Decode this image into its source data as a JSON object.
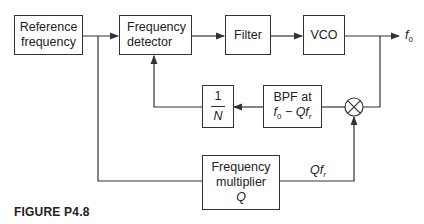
{
  "diagram": {
    "figure_caption": "FIGURE P4.8",
    "blocks": {
      "reference": {
        "line1": "Reference",
        "line2": "frequency"
      },
      "detector": {
        "line1": "Frequency",
        "line2": "detector"
      },
      "filter": {
        "label": "Filter"
      },
      "vco": {
        "label": "VCO"
      },
      "divider": {
        "numerator": "1",
        "denominator": "N"
      },
      "bpf": {
        "line1": "BPF at",
        "line2_f": "f",
        "line2_sub": "0",
        "line2_rest": " − Qf",
        "line2_sub2": "r"
      },
      "multiplier": {
        "line1": "Frequency",
        "line2": "multiplier",
        "line3": "Q"
      },
      "mixer": {
        "symbol": "⊗"
      }
    },
    "signals": {
      "output": {
        "f": "f",
        "sub": "0"
      },
      "multiplied": {
        "q": "Qf",
        "sub": "r"
      }
    },
    "connections": [
      "Reference frequency → Frequency detector",
      "Frequency detector → Filter",
      "Filter → VCO",
      "VCO → f0 output",
      "f0 → Mixer",
      "Reference frequency → Frequency multiplier Q",
      "Frequency multiplier Q → Mixer (Qfr)",
      "Mixer → BPF at f0 − Qfr",
      "BPF → 1/N",
      "1/N → Frequency detector"
    ],
    "colors": {
      "stroke": "#333333",
      "background": "#ffffff"
    }
  }
}
